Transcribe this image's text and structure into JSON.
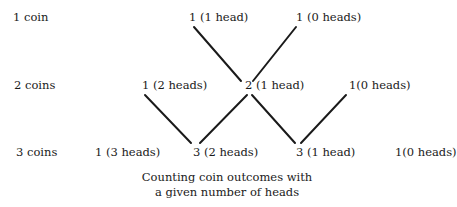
{
  "diagram": {
    "title": "Counting coin outcomes with a given number of heads",
    "caption_lines": [
      "Counting coin outcomes with",
      "a given number of heads"
    ],
    "rows": [
      {
        "label": "1 coin",
        "nodes": [
          {
            "text": "1 (1 head)",
            "count": 1,
            "heads": 1
          },
          {
            "text": "1 (0 heads)",
            "count": 1,
            "heads": 0
          }
        ]
      },
      {
        "label": "2 coins",
        "nodes": [
          {
            "text": "1 (2 heads)",
            "count": 1,
            "heads": 2
          },
          {
            "text": "2 (1 head)",
            "count": 2,
            "heads": 1
          },
          {
            "text": "1(0 heads)",
            "count": 1,
            "heads": 0
          }
        ]
      },
      {
        "label": "3 coins",
        "nodes": [
          {
            "text": "1 (3 heads)",
            "count": 1,
            "heads": 3
          },
          {
            "text": "3 (2 heads)",
            "count": 3,
            "heads": 2
          },
          {
            "text": "3 (1 head)",
            "count": 3,
            "heads": 1
          },
          {
            "text": "1(0 heads)",
            "count": 1,
            "heads": 0
          }
        ]
      }
    ],
    "edges": [
      {
        "from": "1 coin: 1 (1 head)",
        "to": "2 coins: 2 (1 head)"
      },
      {
        "from": "1 coin: 1 (0 heads)",
        "to": "2 coins: 2 (1 head)"
      },
      {
        "from": "2 coins: 1 (2 heads)",
        "to": "3 coins: 3 (2 heads)"
      },
      {
        "from": "2 coins: 2 (1 head)",
        "to": "3 coins: 3 (2 heads)"
      },
      {
        "from": "2 coins: 2 (1 head)",
        "to": "3 coins: 3 (1 head)"
      },
      {
        "from": "2 coins: 1(0 heads)",
        "to": "3 coins: 3 (1 head)"
      }
    ],
    "line_color": "#1a1a1a"
  }
}
